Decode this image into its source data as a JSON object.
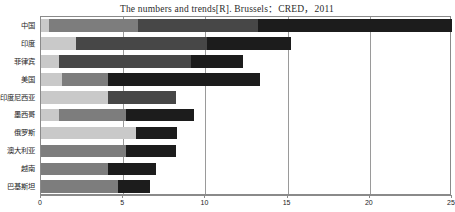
{
  "chart_data": {
    "type": "bar",
    "orientation": "horizontal",
    "stacked": true,
    "title": "The numbers and trends[R]. Brussels：CRED，2011",
    "xlabel": "",
    "ylabel": "",
    "xlim": [
      0,
      25
    ],
    "xticks": [
      0,
      5,
      10,
      15,
      20,
      25
    ],
    "xtick_labels": [
      "0",
      "5",
      "10",
      "15",
      "20",
      "25"
    ],
    "grid": true,
    "grid_axis": "x",
    "legend": "none",
    "categories": [
      "中国",
      "印度",
      "菲律宾",
      "美国",
      "印度尼西亚",
      "墨西哥",
      "俄罗斯",
      "澳大利亚",
      "越南",
      "巴基斯坦"
    ],
    "series": [
      {
        "name": "Segment 1",
        "color": "#c9c9c9",
        "values": [
          0.5,
          2.1,
          1.1,
          1.3,
          4.1,
          1.1,
          5.8,
          0.0,
          0.0,
          0.0
        ]
      },
      {
        "name": "Segment 2",
        "color": "#7d7d7d",
        "values": [
          5.4,
          0.0,
          0.0,
          2.8,
          0.0,
          4.1,
          0.0,
          5.2,
          4.1,
          4.7
        ]
      },
      {
        "name": "Segment 3",
        "color": "#474747",
        "values": [
          7.3,
          8.0,
          8.0,
          0.0,
          4.1,
          0.0,
          0.0,
          0.0,
          0.0,
          0.0
        ]
      },
      {
        "name": "Segment 4",
        "color": "#1c1c1c",
        "values": [
          11.8,
          5.1,
          3.2,
          9.2,
          0.0,
          4.1,
          2.5,
          3.0,
          2.9,
          1.9
        ]
      }
    ],
    "totals": [
      25.0,
      15.2,
      12.3,
      13.3,
      8.2,
      9.3,
      8.3,
      8.2,
      7.0,
      6.6
    ]
  },
  "axis": {
    "x_min_label": "0",
    "x_max_label": "25"
  }
}
